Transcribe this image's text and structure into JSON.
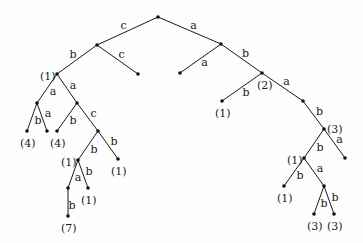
{
  "diagram": {
    "type": "labeled-tree",
    "nodes": [
      {
        "id": "R",
        "x": 158,
        "y": 17,
        "label": ""
      },
      {
        "id": "A",
        "x": 97,
        "y": 45,
        "label": ""
      },
      {
        "id": "B",
        "x": 221,
        "y": 44,
        "label": ""
      },
      {
        "id": "N1",
        "x": 57,
        "y": 74,
        "label": "(1)",
        "lx": -17,
        "ly": 2
      },
      {
        "id": "L1",
        "x": 138,
        "y": 74,
        "label": ""
      },
      {
        "id": "L2",
        "x": 180,
        "y": 73,
        "label": ""
      },
      {
        "id": "N2",
        "x": 262,
        "y": 73,
        "label": "(2)",
        "lx": -5,
        "ly": 12
      },
      {
        "id": "C",
        "x": 37,
        "y": 103,
        "label": ""
      },
      {
        "id": "D",
        "x": 77,
        "y": 103,
        "label": ""
      },
      {
        "id": "L3",
        "x": 27,
        "y": 131,
        "label": "(4)",
        "lx": -7,
        "ly": 12
      },
      {
        "id": "L4",
        "x": 47,
        "y": 131,
        "label": ""
      },
      {
        "id": "L5",
        "x": 57,
        "y": 131,
        "label": "(4)",
        "lx": -7,
        "ly": 12
      },
      {
        "id": "E",
        "x": 98,
        "y": 131,
        "label": ""
      },
      {
        "id": "F",
        "x": 78,
        "y": 160,
        "label": "(1)",
        "lx": -17,
        "ly": 2
      },
      {
        "id": "L6",
        "x": 118,
        "y": 159,
        "label": "(1)",
        "lx": -7,
        "ly": 12
      },
      {
        "id": "G",
        "x": 68,
        "y": 188,
        "label": ""
      },
      {
        "id": "L7",
        "x": 88,
        "y": 188,
        "label": "(1)",
        "lx": -7,
        "ly": 12
      },
      {
        "id": "L8",
        "x": 68,
        "y": 216,
        "label": "(7)",
        "lx": -7,
        "ly": 12
      },
      {
        "id": "L9",
        "x": 222,
        "y": 101,
        "label": "(1)",
        "lx": -7,
        "ly": 12
      },
      {
        "id": "H",
        "x": 303,
        "y": 101,
        "label": ""
      },
      {
        "id": "N3",
        "x": 324,
        "y": 129,
        "label": "(3)",
        "lx": 3,
        "ly": 0
      },
      {
        "id": "N4",
        "x": 304,
        "y": 158,
        "label": "(1)",
        "lx": -17,
        "ly": 2
      },
      {
        "id": "L10",
        "x": 345,
        "y": 158,
        "label": ""
      },
      {
        "id": "L11",
        "x": 284,
        "y": 186,
        "label": "(1)",
        "lx": -7,
        "ly": 12
      },
      {
        "id": "I",
        "x": 324,
        "y": 186,
        "label": ""
      },
      {
        "id": "L12",
        "x": 314,
        "y": 214,
        "label": "(3)",
        "lx": -7,
        "ly": 12
      },
      {
        "id": "L13",
        "x": 334,
        "y": 214,
        "label": "(3)",
        "lx": -7,
        "ly": 12
      }
    ],
    "edges": [
      {
        "from": "R",
        "to": "A",
        "label": "c",
        "lx": -4,
        "ly": -5
      },
      {
        "from": "R",
        "to": "B",
        "label": "a",
        "lx": 4,
        "ly": -5
      },
      {
        "from": "A",
        "to": "N1",
        "label": "b",
        "lx": -4,
        "ly": -5
      },
      {
        "from": "A",
        "to": "L1",
        "label": "c",
        "lx": 4,
        "ly": -5
      },
      {
        "from": "B",
        "to": "L2",
        "label": "a",
        "lx": 4,
        "ly": 4
      },
      {
        "from": "B",
        "to": "N2",
        "label": "b",
        "lx": 4,
        "ly": -5
      },
      {
        "from": "N1",
        "to": "C",
        "label": "a",
        "lx": 6,
        "ly": 3
      },
      {
        "from": "N1",
        "to": "D",
        "label": "a",
        "lx": 6,
        "ly": -3
      },
      {
        "from": "C",
        "to": "L3",
        "label": "b",
        "lx": 6,
        "ly": 4
      },
      {
        "from": "C",
        "to": "L4",
        "label": "a",
        "lx": 6,
        "ly": -3
      },
      {
        "from": "D",
        "to": "L5",
        "label": "b",
        "lx": 6,
        "ly": 4
      },
      {
        "from": "D",
        "to": "E",
        "label": "c",
        "lx": 6,
        "ly": -3
      },
      {
        "from": "E",
        "to": "F",
        "label": "b",
        "lx": 6,
        "ly": 4
      },
      {
        "from": "E",
        "to": "L6",
        "label": "b",
        "lx": 6,
        "ly": -3
      },
      {
        "from": "F",
        "to": "G",
        "label": "a",
        "lx": 5,
        "ly": 4
      },
      {
        "from": "F",
        "to": "L7",
        "label": "b",
        "lx": 6,
        "ly": -2
      },
      {
        "from": "G",
        "to": "L8",
        "label": "b",
        "lx": 4,
        "ly": 4
      },
      {
        "from": "N2",
        "to": "L9",
        "label": "b",
        "lx": 4,
        "ly": 6
      },
      {
        "from": "N2",
        "to": "H",
        "label": "a",
        "lx": 4,
        "ly": -5
      },
      {
        "from": "H",
        "to": "N3",
        "label": "b",
        "lx": 6,
        "ly": -3
      },
      {
        "from": "N3",
        "to": "N4",
        "label": "b",
        "lx": 6,
        "ly": 4
      },
      {
        "from": "N3",
        "to": "L10",
        "label": "a",
        "lx": 5,
        "ly": -4
      },
      {
        "from": "N4",
        "to": "L11",
        "label": "b",
        "lx": 6,
        "ly": 4
      },
      {
        "from": "N4",
        "to": "I",
        "label": "a",
        "lx": 6,
        "ly": -3
      },
      {
        "from": "I",
        "to": "L12",
        "label": "b",
        "lx": 5,
        "ly": 4
      },
      {
        "from": "I",
        "to": "L13",
        "label": "b",
        "lx": 6,
        "ly": -2
      }
    ]
  }
}
